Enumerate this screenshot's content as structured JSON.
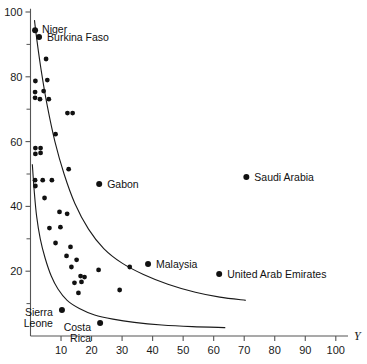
{
  "chart_data": {
    "type": "scatter",
    "title": "",
    "xlabel": "Y",
    "ylabel": "",
    "xlim": [
      0,
      104
    ],
    "ylim": [
      0,
      101
    ],
    "grid": false,
    "legend": "none",
    "xticks_major": [
      10,
      20,
      30,
      40,
      50,
      60,
      70,
      80,
      90,
      100
    ],
    "xtick_labels": [
      "10",
      "20",
      "30",
      "40",
      "50",
      "60",
      "70",
      "80",
      "90",
      "100"
    ],
    "yticks_major": [
      20,
      40,
      60,
      80,
      100
    ],
    "ytick_labels": [
      "20",
      "40",
      "60",
      "80",
      "100"
    ],
    "yticks_minor": [
      10,
      30,
      50,
      70,
      90
    ],
    "labeled_points": [
      {
        "name": "Niger",
        "x": 1.5,
        "y": 94.4,
        "label_dx": 7,
        "label_dy": 3
      },
      {
        "name": "Burkina Faso",
        "x": 2.8,
        "y": 92.3,
        "label_dx": 8,
        "label_dy": 4
      },
      {
        "name": "Gabon",
        "x": 22.5,
        "y": 46.9,
        "label_dx": 8,
        "label_dy": 4
      },
      {
        "name": "Saudi Arabia",
        "x": 70.7,
        "y": 49.1,
        "label_dx": 8,
        "label_dy": 4
      },
      {
        "name": "Malaysia",
        "x": 38.5,
        "y": 22.2,
        "label_dx": 8,
        "label_dy": 4
      },
      {
        "name": "United Arab Emirates",
        "x": 61.8,
        "y": 19.1,
        "label_dx": 8,
        "label_dy": 4
      },
      {
        "name": "Sierra Leone",
        "x": 10.3,
        "y": 8.0,
        "label_dx": -9,
        "label_dy": 6
      },
      {
        "name": "Costa Rica",
        "x": 22.8,
        "y": 4.0,
        "label_dx": -9,
        "label_dy": 8
      }
    ],
    "points": [
      {
        "x": 1.5,
        "y": 94.4
      },
      {
        "x": 2.8,
        "y": 92.3
      },
      {
        "x": 5.1,
        "y": 85.5
      },
      {
        "x": 1.6,
        "y": 78.7
      },
      {
        "x": 5.5,
        "y": 79.0
      },
      {
        "x": 1.5,
        "y": 75.3
      },
      {
        "x": 4.3,
        "y": 75.6
      },
      {
        "x": 1.5,
        "y": 73.5
      },
      {
        "x": 3.1,
        "y": 73.1
      },
      {
        "x": 6.0,
        "y": 73.1
      },
      {
        "x": 12.1,
        "y": 68.8
      },
      {
        "x": 13.8,
        "y": 68.8
      },
      {
        "x": 8.2,
        "y": 62.3
      },
      {
        "x": 1.6,
        "y": 58.0
      },
      {
        "x": 3.3,
        "y": 58.0
      },
      {
        "x": 1.6,
        "y": 56.2
      },
      {
        "x": 3.3,
        "y": 56.5
      },
      {
        "x": 12.5,
        "y": 51.5
      },
      {
        "x": 1.5,
        "y": 48.1
      },
      {
        "x": 4.0,
        "y": 48.1
      },
      {
        "x": 7.0,
        "y": 48.1
      },
      {
        "x": 1.6,
        "y": 46.3
      },
      {
        "x": 4.6,
        "y": 42.6
      },
      {
        "x": 9.5,
        "y": 38.3
      },
      {
        "x": 12.0,
        "y": 37.7
      },
      {
        "x": 6.2,
        "y": 33.3
      },
      {
        "x": 9.8,
        "y": 33.6
      },
      {
        "x": 8.2,
        "y": 28.7
      },
      {
        "x": 13.1,
        "y": 27.5
      },
      {
        "x": 11.8,
        "y": 24.7
      },
      {
        "x": 15.1,
        "y": 23.5
      },
      {
        "x": 13.4,
        "y": 21.3
      },
      {
        "x": 22.3,
        "y": 20.4
      },
      {
        "x": 32.5,
        "y": 21.3
      },
      {
        "x": 16.4,
        "y": 18.5
      },
      {
        "x": 17.7,
        "y": 18.2
      },
      {
        "x": 14.4,
        "y": 16.4
      },
      {
        "x": 16.7,
        "y": 16.7
      },
      {
        "x": 29.2,
        "y": 14.2
      },
      {
        "x": 15.7,
        "y": 13.3
      },
      {
        "x": 10.3,
        "y": 8.0
      },
      {
        "x": 22.8,
        "y": 4.0
      },
      {
        "x": 22.5,
        "y": 46.9
      },
      {
        "x": 70.7,
        "y": 49.1
      },
      {
        "x": 38.5,
        "y": 22.2
      },
      {
        "x": 61.8,
        "y": 19.1
      }
    ],
    "curves": [
      {
        "name": "upper-envelope",
        "points": [
          [
            1.3,
            97.5
          ],
          [
            2.0,
            92.0
          ],
          [
            3.5,
            82.0
          ],
          [
            5.5,
            71.0
          ],
          [
            8.0,
            60.0
          ],
          [
            11.0,
            50.0
          ],
          [
            14.5,
            41.0
          ],
          [
            19.0,
            33.0
          ],
          [
            24.0,
            27.0
          ],
          [
            30.0,
            22.5
          ],
          [
            37.0,
            19.0
          ],
          [
            45.0,
            16.0
          ],
          [
            54.0,
            13.5
          ],
          [
            62.0,
            12.0
          ],
          [
            70.5,
            11.0
          ]
        ]
      },
      {
        "name": "lower-envelope",
        "points": [
          [
            0.6,
            53.0
          ],
          [
            1.2,
            45.0
          ],
          [
            2.0,
            37.0
          ],
          [
            3.2,
            30.0
          ],
          [
            4.8,
            24.0
          ],
          [
            6.8,
            18.5
          ],
          [
            9.0,
            14.5
          ],
          [
            12.0,
            11.0
          ],
          [
            16.0,
            8.5
          ],
          [
            21.0,
            6.5
          ],
          [
            27.0,
            5.2
          ],
          [
            34.0,
            4.2
          ],
          [
            43.0,
            3.4
          ],
          [
            53.0,
            2.9
          ],
          [
            63.8,
            2.6
          ]
        ]
      }
    ]
  }
}
